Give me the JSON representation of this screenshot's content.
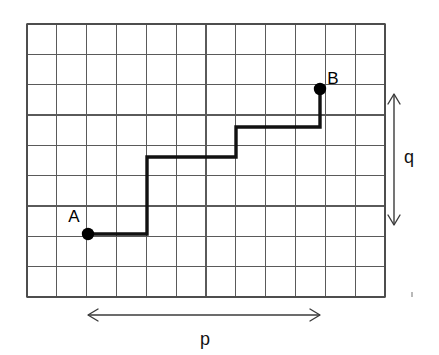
{
  "figure": {
    "background_color": "#ffffff",
    "width": 439,
    "height": 355
  },
  "grid": {
    "columns": 12,
    "rows": 9,
    "origin_x": 27,
    "origin_y": 24,
    "cell_width": 29.83,
    "cell_height": 30.33,
    "line_color": "#5a5a5a",
    "border_color": "#4a4a4a"
  },
  "points": [
    {
      "id": "A",
      "label": "A",
      "x": 88,
      "y": 234,
      "grid_col": 2,
      "grid_row": 7,
      "label_x": 74,
      "label_y": 222,
      "radius": 6.2
    },
    {
      "id": "B",
      "label": "B",
      "x": 320,
      "y": 89,
      "grid_col": 9.8,
      "grid_row": 2.15,
      "label_x": 333,
      "label_y": 84,
      "radius": 6.2
    }
  ],
  "path": {
    "name": "staircase-path",
    "color": "#111111",
    "stroke_width": 3.4,
    "vertices": [
      [
        88,
        234
      ],
      [
        147,
        234
      ],
      [
        147,
        157
      ],
      [
        236,
        157
      ],
      [
        236,
        127
      ],
      [
        320,
        127
      ],
      [
        320,
        89
      ]
    ],
    "points_string": "88,234 147,234 147,157 236,157 236,127 320,127 320,89"
  },
  "dimensions": [
    {
      "id": "p",
      "label": "p",
      "orientation": "horizontal",
      "axis_pos": 315,
      "start": 88,
      "end": 320,
      "label_x": 205,
      "label_y": 345,
      "line_d": "M 88 315 L 320 315",
      "head_start_d": "M 98 309 L 88 315 L 98 321",
      "head_end_d": "M 310 309 L 320 315 L 310 321"
    },
    {
      "id": "q",
      "label": "q",
      "orientation": "vertical",
      "axis_pos": 394,
      "start": 94,
      "end": 225,
      "label_x": 409,
      "label_y": 163,
      "line_d": "M 394 94 L 394 225",
      "head_start_d": "M 388 104 L 394 94 L 400 104",
      "head_end_d": "M 388 215 L 394 225 L 400 215"
    }
  ],
  "grid_vertical_lines_d": "M 27 24 L 27 297 M 56.8 24 L 56.8 297 M 86.7 24 L 86.7 297 M 116.5 24 L 116.5 297 M 146.3 24 L 146.3 297 M 176.2 24 L 176.2 297 M 206 24 L 206 297 M 235.8 24 L 235.8 297 M 265.7 24 L 265.7 297 M 295.5 24 L 295.5 297 M 325.3 24 L 325.3 297 M 355.2 24 L 355.2 297 M 385 24 L 385 297",
  "grid_horizontal_lines_d": "M 27 24 L 385 24 M 27 54.3 L 385 54.3 M 27 84.7 L 385 84.7 M 27 115 L 385 115 M 27 145.3 L 385 145.3 M 27 175.7 L 385 175.7 M 27 206 L 385 206 M 27 236.3 L 385 236.3 M 27 266.7 L 385 266.7 M 27 297 L 385 297",
  "grid_border_d": "M 27 24 L 385 24 L 385 297 L 27 297 Z"
}
